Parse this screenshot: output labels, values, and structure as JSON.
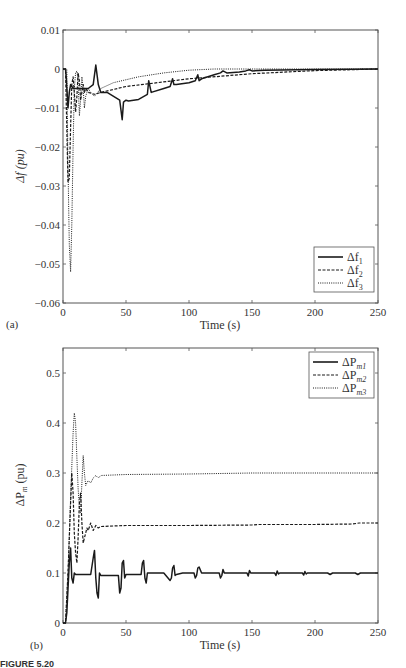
{
  "chart_data": [
    {
      "type": "line",
      "panel": "(a)",
      "title": "",
      "xlabel": "Time (s)",
      "ylabel": "Δf (pu)",
      "xlim": [
        0,
        250
      ],
      "ylim": [
        -0.06,
        0.01
      ],
      "xticks": [
        0,
        50,
        100,
        150,
        200,
        250
      ],
      "yticks": [
        0.01,
        0,
        -0.01,
        -0.02,
        -0.03,
        -0.04,
        -0.05,
        -0.06
      ],
      "ytick_labels": [
        "0.01",
        "0",
        "−0.01",
        "−0.02",
        "−0.03",
        "−0.04",
        "−0.05",
        "−0.06"
      ],
      "grid": false,
      "legend_position": "lower right",
      "series": [
        {
          "name": "Δf1",
          "style": "solid",
          "x": [
            0,
            2,
            2.5,
            4,
            5,
            6,
            7,
            8,
            10,
            15,
            20,
            24,
            26,
            28,
            30,
            35,
            45,
            47,
            48,
            50,
            52,
            60,
            67,
            68,
            70,
            80,
            85,
            87,
            88,
            90,
            100,
            105,
            107,
            108,
            110,
            120,
            125,
            127,
            130,
            140,
            145,
            148,
            150,
            160,
            200,
            250
          ],
          "values": [
            0,
            0,
            -0.002,
            -0.01,
            -0.006,
            -0.004,
            -0.0045,
            -0.005,
            -0.005,
            -0.005,
            -0.005,
            -0.004,
            0.001,
            -0.004,
            -0.006,
            -0.006,
            -0.008,
            -0.013,
            -0.0085,
            -0.008,
            -0.0082,
            -0.0078,
            -0.0065,
            -0.003,
            -0.006,
            -0.005,
            -0.0045,
            -0.0025,
            -0.004,
            -0.004,
            -0.0035,
            -0.003,
            -0.0015,
            -0.003,
            -0.0025,
            -0.0015,
            -0.001,
            -0.0005,
            -0.001,
            -0.0008,
            -0.0005,
            -0.0002,
            -0.0005,
            -0.0003,
            -0.0001,
            0
          ]
        },
        {
          "name": "Δf2",
          "style": "dashed",
          "x": [
            0,
            2,
            3,
            4,
            5,
            6,
            7,
            8,
            9,
            10,
            11,
            12,
            13,
            14,
            15,
            16,
            17,
            18,
            20,
            25,
            30,
            50,
            100,
            150,
            200,
            250
          ],
          "values": [
            0,
            0,
            -0.015,
            -0.029,
            -0.028,
            -0.015,
            -0.004,
            -0.002,
            -0.006,
            -0.011,
            -0.007,
            -0.001,
            -0.003,
            -0.008,
            -0.006,
            -0.004,
            -0.006,
            -0.005,
            -0.006,
            -0.0065,
            -0.006,
            -0.0045,
            -0.0025,
            -0.0012,
            -0.0004,
            0
          ]
        },
        {
          "name": "Δf3",
          "style": "dotted",
          "x": [
            0,
            3,
            4,
            5,
            6,
            7,
            8,
            9,
            10,
            11,
            12,
            13,
            14,
            15,
            16,
            17,
            18,
            20,
            22,
            25,
            30,
            40,
            60,
            80,
            100,
            120,
            150,
            200,
            250
          ],
          "values": [
            0,
            0,
            -0.025,
            -0.045,
            -0.052,
            -0.04,
            -0.02,
            -0.005,
            -0.001,
            -0.0005,
            -0.003,
            -0.012,
            -0.008,
            -0.002,
            -0.005,
            -0.01,
            -0.007,
            -0.005,
            -0.006,
            -0.007,
            -0.005,
            -0.0035,
            -0.002,
            -0.001,
            -0.0003,
            0,
            0,
            0,
            0
          ]
        }
      ]
    },
    {
      "type": "line",
      "panel": "(b)",
      "title": "",
      "xlabel": "Time (s)",
      "ylabel": "ΔPm (pu)",
      "xlim": [
        0,
        250
      ],
      "ylim": [
        0,
        0.55
      ],
      "xticks": [
        0,
        50,
        100,
        150,
        200,
        250
      ],
      "yticks": [
        0,
        0.1,
        0.2,
        0.3,
        0.4,
        0.5
      ],
      "ytick_labels": [
        "0",
        "0.1",
        "0.2",
        "0.3",
        "0.4",
        "0.5"
      ],
      "grid": false,
      "legend_position": "upper right",
      "series": [
        {
          "name": "ΔPm1",
          "style": "solid",
          "x": [
            0,
            2,
            3,
            5,
            6,
            7,
            8,
            9,
            10,
            15,
            22,
            24,
            25,
            26,
            27,
            28,
            29,
            30,
            35,
            44,
            45,
            46,
            47,
            48,
            49,
            50,
            55,
            62,
            63,
            64,
            65,
            66,
            67,
            68,
            70,
            80,
            85,
            86,
            87,
            88,
            89,
            90,
            95,
            104,
            105,
            106,
            107,
            108,
            110,
            124,
            125,
            126,
            127,
            128,
            130,
            146,
            147,
            148,
            149,
            150,
            168,
            169,
            170,
            171,
            172,
            190,
            191,
            192,
            193,
            194,
            210,
            212,
            214,
            232,
            234,
            236,
            250
          ],
          "values": [
            0,
            0,
            0.02,
            0.12,
            0.15,
            0.09,
            0.08,
            0.1,
            0.097,
            0.097,
            0.097,
            0.13,
            0.145,
            0.09,
            0.06,
            0.05,
            0.1,
            0.095,
            0.095,
            0.095,
            0.06,
            0.07,
            0.12,
            0.125,
            0.09,
            0.097,
            0.097,
            0.097,
            0.12,
            0.125,
            0.09,
            0.08,
            0.1,
            0.1,
            0.1,
            0.1,
            0.085,
            0.09,
            0.11,
            0.115,
            0.095,
            0.097,
            0.1,
            0.1,
            0.09,
            0.095,
            0.11,
            0.112,
            0.1,
            0.1,
            0.09,
            0.095,
            0.107,
            0.1,
            0.1,
            0.1,
            0.094,
            0.105,
            0.1,
            0.1,
            0.1,
            0.095,
            0.104,
            0.098,
            0.1,
            0.1,
            0.096,
            0.103,
            0.098,
            0.1,
            0.1,
            0.097,
            0.1,
            0.1,
            0.097,
            0.1,
            0.1
          ]
        },
        {
          "name": "ΔPm2",
          "style": "dashed",
          "x": [
            0,
            2,
            4,
            6,
            7,
            8,
            9,
            10,
            11,
            12,
            13,
            14,
            15,
            16,
            17,
            18,
            19,
            20,
            22,
            24,
            26,
            28,
            30,
            50,
            100,
            150,
            155,
            200,
            230,
            235,
            250
          ],
          "values": [
            0,
            0,
            0.1,
            0.24,
            0.3,
            0.26,
            0.18,
            0.14,
            0.12,
            0.17,
            0.24,
            0.26,
            0.2,
            0.16,
            0.17,
            0.18,
            0.19,
            0.185,
            0.2,
            0.185,
            0.195,
            0.19,
            0.193,
            0.195,
            0.195,
            0.196,
            0.197,
            0.197,
            0.198,
            0.2,
            0.2
          ]
        },
        {
          "name": "ΔPm3",
          "style": "dotted",
          "x": [
            0,
            2,
            4,
            6,
            8,
            9,
            10,
            11,
            12,
            13,
            14,
            15,
            16,
            17,
            18,
            19,
            20,
            22,
            24,
            26,
            28,
            30,
            50,
            100,
            150,
            200,
            250
          ],
          "values": [
            0,
            0,
            0.1,
            0.25,
            0.38,
            0.42,
            0.4,
            0.33,
            0.27,
            0.23,
            0.22,
            0.28,
            0.335,
            0.3,
            0.275,
            0.28,
            0.285,
            0.28,
            0.29,
            0.295,
            0.29,
            0.295,
            0.297,
            0.298,
            0.3,
            0.3,
            0.3
          ]
        }
      ]
    }
  ],
  "figure": {
    "panel_a": {
      "label": "(a)",
      "xlabel": "Time (s)",
      "ylabel": "Δf (pu)",
      "xtick_labels": [
        "0",
        "50",
        "100",
        "150",
        "200",
        "250"
      ],
      "legend": [
        "Δf",
        "Δf",
        "Δf"
      ],
      "legend_sub": [
        "1",
        "2",
        "3"
      ]
    },
    "panel_b": {
      "label": "(b)",
      "xlabel": "Time (s)",
      "ylabel": "ΔP",
      "ylabel_sub": "m",
      "ylabel_suffix": " (pu)",
      "xtick_labels": [
        "0",
        "50",
        "100",
        "150",
        "200",
        "250"
      ],
      "legend": [
        "ΔP",
        "ΔP",
        "ΔP"
      ],
      "legend_sub": [
        "m1",
        "m2",
        "m3"
      ]
    },
    "caption": "FIGURE 5.20"
  },
  "colors": {
    "line": "#1a1a1a",
    "axis": "#555555",
    "background": "#ffffff"
  }
}
